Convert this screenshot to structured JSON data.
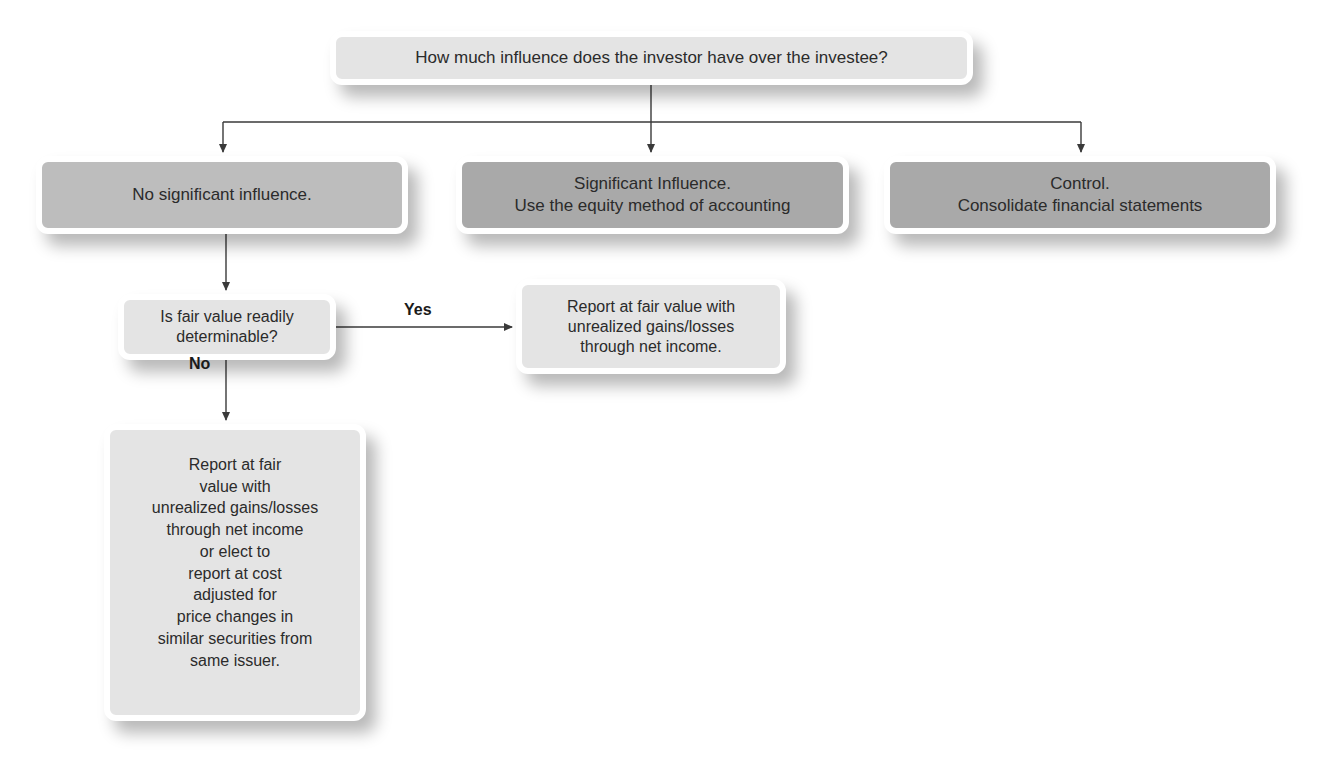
{
  "diagram": {
    "type": "decision-flowchart",
    "root_question": "How much influence does the investor have over the investee?",
    "level1": [
      {
        "id": "no-significant-influence",
        "lines": [
          "No significant influence."
        ],
        "shade": "#bdbdbd"
      },
      {
        "id": "significant-influence",
        "lines": [
          "Significant Influence.",
          "Use the equity method of accounting"
        ],
        "shade": "#a9a9a9"
      },
      {
        "id": "control",
        "lines": [
          "Control.",
          "Consolidate financial statements"
        ],
        "shade": "#a9a9a9"
      }
    ],
    "fair_value_question": {
      "lines": [
        "Is fair value readily",
        "determinable?"
      ]
    },
    "edges": {
      "yes_label": "Yes",
      "no_label": "No"
    },
    "yes_outcome": {
      "lines": [
        "Report at fair value with",
        "unrealized gains/losses",
        "through net income."
      ]
    },
    "no_outcome": {
      "lines": [
        "Report at fair",
        "value with",
        "unrealized gains/losses",
        "through net income",
        "or elect to",
        "report at cost",
        "adjusted for",
        "price changes in",
        "similar securities from",
        "same issuer."
      ]
    },
    "colors": {
      "light_box": "#e4e4e4",
      "mid_box": "#bdbdbd",
      "dark_box": "#a9a9a9",
      "connector": "#3a3a3a"
    }
  }
}
